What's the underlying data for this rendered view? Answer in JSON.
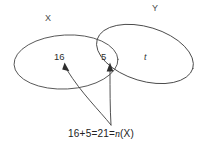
{
  "diagram": {
    "type": "venn-two-set",
    "sets": [
      {
        "id": "x",
        "label": "X"
      },
      {
        "id": "y",
        "label": "Y"
      }
    ],
    "regions": [
      {
        "id": "x-only",
        "label": "16"
      },
      {
        "id": "intersection",
        "label": "5"
      },
      {
        "id": "y-only",
        "label": "t"
      }
    ],
    "equation": {
      "term_a": "16",
      "plus": "+",
      "term_b": "5",
      "equals_1": "=",
      "sum": "21",
      "equals_2": "=",
      "function_name": "n",
      "function_arg": "(X)",
      "full_text": "16 + 5 = 21 = n(X)"
    },
    "annotations": {
      "leader_target_1": "16",
      "leader_target_2": "5"
    },
    "colors": {
      "stroke": "#4a4a4a",
      "text": "#2e2e2e",
      "background": "#ffffff"
    }
  }
}
